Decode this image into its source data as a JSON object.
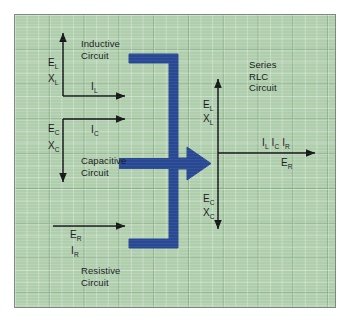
{
  "figure": {
    "background_color": "#b4d3b2",
    "grid_color": "#6a9668",
    "border_color": "#7d8a7d",
    "arrow_color": "#2a4a96",
    "axis_color": "#16181a"
  },
  "inductive": {
    "caption_line1": "Inductive",
    "caption_line2": "Circuit",
    "vertical_label_1": "E",
    "vertical_sub_1": "L",
    "vertical_label_2": "X",
    "vertical_sub_2": "L",
    "horizontal_label": "I",
    "horizontal_sub": "L"
  },
  "capacitive": {
    "caption_line1": "Capacitive",
    "caption_line2": "Circuit",
    "vertical_label_1": "E",
    "vertical_sub_1": "C",
    "vertical_label_2": "X",
    "vertical_sub_2": "C",
    "horizontal_label": "I",
    "horizontal_sub": "C"
  },
  "resistive": {
    "caption_line1": "Resistive",
    "caption_line2": "Circuit",
    "label_1": "E",
    "sub_1": "R",
    "label_2": "I",
    "sub_2": "R"
  },
  "series_rlc": {
    "caption_line1": "Series",
    "caption_line2": "RLC",
    "caption_line3": "Circuit",
    "up_label_1": "E",
    "up_sub_1": "L",
    "up_label_2": "X",
    "up_sub_2": "L",
    "down_label_1": "E",
    "down_sub_1": "C",
    "down_label_2": "X",
    "down_sub_2": "C",
    "current_label_1": "I",
    "current_sub_1": "L",
    "current_label_2": "I",
    "current_sub_2": "C",
    "current_label_3": "I",
    "current_sub_3": "R",
    "voltage_label": "E",
    "voltage_sub": "R"
  }
}
